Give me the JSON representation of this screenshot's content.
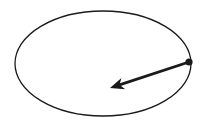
{
  "diagram": {
    "background": "#ffffff",
    "stroke_color": "#1a1a1a",
    "ellipse": {
      "cx": 103,
      "cy": 63.5,
      "rx": 88,
      "ry": 52.5,
      "stroke_width": 1.3
    },
    "point": {
      "x": 189,
      "y": 62,
      "r": 3.6
    },
    "arrow": {
      "x1": 189,
      "y1": 62,
      "x2": 110,
      "y2": 88,
      "stroke_width": 2.8
    }
  }
}
